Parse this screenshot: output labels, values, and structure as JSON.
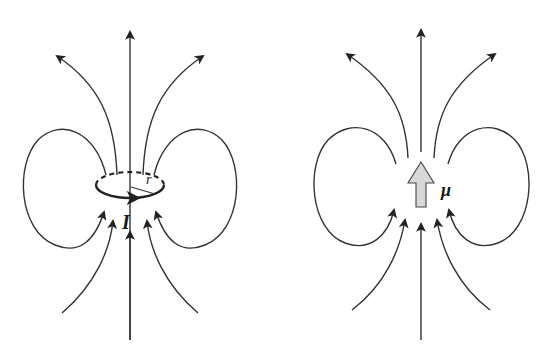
{
  "diagram": {
    "left_panel": {
      "name": "current-loop",
      "labels": {
        "current": "I",
        "radius": "r"
      }
    },
    "right_panel": {
      "name": "magnetic-dipole",
      "labels": {
        "moment": "μ"
      }
    },
    "colors": {
      "line": "#222222",
      "arrow_fill": "#d8d8d8",
      "background": "#ffffff"
    }
  }
}
